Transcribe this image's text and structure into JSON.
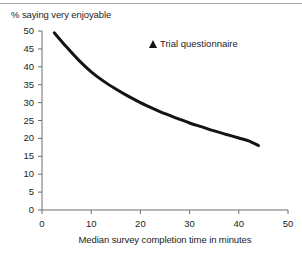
{
  "chart_data": {
    "type": "line",
    "title": "",
    "subtitle": "",
    "ylabel": "% saying very enjoyable",
    "xlabel": "Median survey completion time in minutes",
    "xlim": [
      0,
      50
    ],
    "ylim": [
      0,
      50
    ],
    "xticks": [
      "0",
      "10",
      "20",
      "30",
      "40",
      "50"
    ],
    "xtick_values": [
      0,
      10,
      20,
      30,
      40,
      50
    ],
    "yticks": [
      "0",
      "5",
      "10",
      "15",
      "20",
      "25",
      "30",
      "35",
      "40",
      "45",
      "50"
    ],
    "ytick_values": [
      0,
      5,
      10,
      15,
      20,
      25,
      30,
      35,
      40,
      45,
      50
    ],
    "grid": false,
    "legend_position": "inside-top-right",
    "legend": [
      {
        "label": "Trial questionnaire",
        "marker": "filled-triangle-up",
        "color": "#141414"
      }
    ],
    "series": [
      {
        "name": "Trial questionnaire",
        "color": "#141414",
        "line_width": 3,
        "x": [
          2.5,
          5,
          7.5,
          10,
          12.5,
          15,
          17.5,
          20,
          22.5,
          25,
          27.5,
          30,
          32.5,
          35,
          37.5,
          40,
          42,
          44
        ],
        "values": [
          49.5,
          45.5,
          41.8,
          38.6,
          36.0,
          33.8,
          31.8,
          30.0,
          28.4,
          26.9,
          25.6,
          24.3,
          23.2,
          22.1,
          21.1,
          20.1,
          19.3,
          18.0
        ]
      }
    ],
    "annotations": []
  },
  "axes": {
    "y_axis_name": "percent-axis",
    "x_axis_name": "time-axis"
  },
  "colors": {
    "line": "#141414",
    "axis": "#6e6e6e",
    "text": "#1d1d1d",
    "background": "#ffffff",
    "top_rule": "#a9a9a9"
  }
}
